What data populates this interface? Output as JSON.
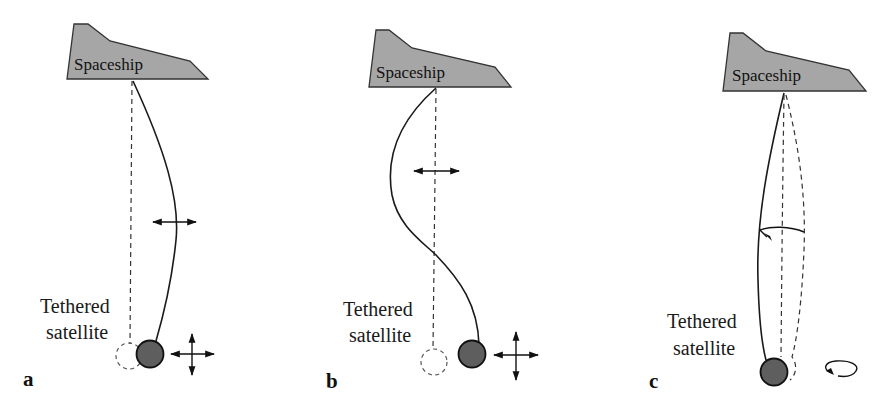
{
  "figure": {
    "panels": [
      {
        "id": "a",
        "letter": "a",
        "spaceship_label": "Spaceship",
        "satellite_label_line1": "Tethered",
        "satellite_label_line2": "satellite",
        "motion": "tether bows to one side (first mode lateral oscillation); satellite offset from dashed equilibrium position; horizontal double arrow on tether; four-way arrow next to satellite"
      },
      {
        "id": "b",
        "letter": "b",
        "spaceship_label": "Spaceship",
        "satellite_label_line1": "Tethered",
        "satellite_label_line2": "satellite",
        "motion": "tether in S-shape (second mode lateral oscillation); horizontal double arrow on tether; four-way arrow next to satellite"
      },
      {
        "id": "c",
        "letter": "c",
        "spaceship_label": "Spaceship",
        "satellite_label_line1": "Tethered",
        "satellite_label_line2": "satellite",
        "motion": "tether sweeps a cone (rotational/skipping-rope mode); curved rotation arrow on tether; circular rotation arrow next to satellite"
      }
    ],
    "colors": {
      "spaceship_fill": "#a6a6a6",
      "satellite_fill": "#5e5e5e",
      "line": "#1a1a1a",
      "background": "#ffffff"
    }
  }
}
